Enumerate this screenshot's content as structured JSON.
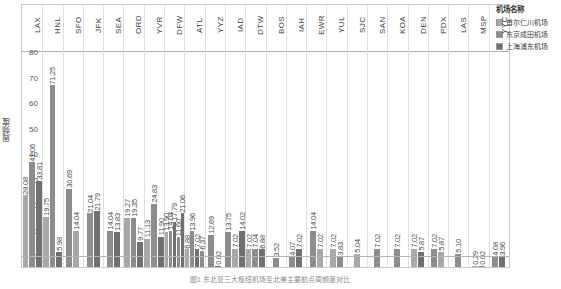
{
  "legend": {
    "title": "机场名称",
    "items": [
      {
        "label": "首尔仁川机场",
        "color": "#a8a8a8"
      },
      {
        "label": "东京成田机场",
        "color": "#8d8d8d"
      },
      {
        "label": "上海浦东机场",
        "color": "#707070"
      }
    ]
  },
  "caption": "图1 东北亚三大枢纽机场至北美主要航点周频度对比",
  "chart_data": {
    "type": "bar",
    "title": "",
    "xlabel": "",
    "ylabel": "周频度",
    "ylim": [
      0,
      80
    ],
    "yticks": [
      0,
      10,
      20,
      30,
      40,
      50,
      60,
      70,
      80
    ],
    "grid": false,
    "legend_position": "right",
    "categories": [
      "LAX",
      "HNL",
      "SFO",
      "JFK",
      "SEA",
      "ORD",
      "YVR",
      "DFW",
      "ATL",
      "YYZ",
      "IAD",
      "DTW",
      "BOS",
      "IAH",
      "EWR",
      "YUL",
      "SJC",
      "SAN",
      "KOA",
      "DEN",
      "PDX",
      "LAS",
      "MSP",
      "YYC"
    ],
    "series": [
      {
        "name": "首尔仁川机场",
        "color": "#a8a8a8",
        "values": [
          28.08,
          19.75,
          30.69,
          21.04,
          14.04,
          19.27,
          11.13,
          13.9,
          6.88,
          12.69,
          13.75,
          7.02,
          6.88,
          7.02,
          14.04,
          7.02,
          5.04,
          7.02,
          7.02,
          7.02,
          5.87,
          0.29,
          4.08,
          null
        ]
      },
      {
        "name": "东京成田机场",
        "color": "#8d8d8d",
        "values": [
          41.06,
          71.25,
          14.04,
          21.79,
          13.83,
          19.35,
          24.83,
          14.04,
          13.96,
          0.02,
          7.02,
          7.04,
          3.52,
          4.07,
          7.02,
          3.83,
          7.02,
          7.02,
          7.02,
          7.02,
          5.1,
          0.02,
          3.96,
          null
        ]
      },
      {
        "name": "上海浦东机场",
        "color": "#707070",
        "values": [
          33.81,
          5.98,
          null,
          null,
          null,
          9.77,
          11.9,
          17.79,
          7.02,
          null,
          14.02,
          6.88,
          null,
          7.02,
          null,
          null,
          null,
          null,
          null,
          5.87,
          null,
          null,
          null,
          null
        ]
      },
      {
        "name": "series-4",
        "color": "#8d8d8d",
        "values": [
          null,
          null,
          null,
          null,
          null,
          null,
          null,
          11.6,
          6.37,
          null,
          null,
          null,
          null,
          null,
          null,
          null,
          null,
          null,
          null,
          null,
          null,
          null,
          null,
          null
        ]
      },
      {
        "name": "series-5",
        "color": "#707070",
        "values": [
          null,
          null,
          null,
          null,
          null,
          null,
          null,
          21.06,
          null,
          null,
          null,
          null,
          null,
          null,
          null,
          null,
          null,
          null,
          null,
          null,
          null,
          null,
          null,
          null
        ]
      }
    ],
    "groups": [
      {
        "code": "LAX",
        "bars": [
          {
            "v": 28.08,
            "c": "#a8a8a8"
          },
          {
            "v": 41.06,
            "c": "#8d8d8d"
          },
          {
            "v": 33.81,
            "c": "#707070"
          }
        ]
      },
      {
        "code": "HNL",
        "bars": [
          {
            "v": 19.75,
            "c": "#a8a8a8"
          },
          {
            "v": 71.25,
            "c": "#8d8d8d"
          },
          {
            "v": 5.98,
            "c": "#707070"
          }
        ]
      },
      {
        "code": "SFO",
        "bars": [
          {
            "v": 30.69,
            "c": "#8d8d8d"
          },
          {
            "v": 14.04,
            "c": "#a8a8a8"
          }
        ]
      },
      {
        "code": "JFK",
        "bars": [
          {
            "v": 21.04,
            "c": "#8d8d8d"
          },
          {
            "v": 21.79,
            "c": "#707070"
          }
        ]
      },
      {
        "code": "SEA",
        "bars": [
          {
            "v": 14.04,
            "c": "#8d8d8d"
          },
          {
            "v": 13.83,
            "c": "#707070"
          }
        ]
      },
      {
        "code": "ORD",
        "bars": [
          {
            "v": 19.27,
            "c": "#a8a8a8"
          },
          {
            "v": 19.35,
            "c": "#8d8d8d"
          },
          {
            "v": 9.77,
            "c": "#707070"
          }
        ]
      },
      {
        "code": "YVR",
        "bars": [
          {
            "v": 11.13,
            "c": "#a8a8a8"
          },
          {
            "v": 24.83,
            "c": "#8d8d8d"
          },
          {
            "v": 11.9,
            "c": "#707070"
          }
        ]
      },
      {
        "code": "DFW",
        "bars": [
          {
            "v": 13.9,
            "c": "#a8a8a8"
          },
          {
            "v": 14.04,
            "c": "#8d8d8d"
          },
          {
            "v": 17.79,
            "c": "#707070"
          },
          {
            "v": 11.6,
            "c": "#8d8d8d"
          },
          {
            "v": 21.06,
            "c": "#707070"
          }
        ]
      },
      {
        "code": "ATL",
        "bars": [
          {
            "v": 6.88,
            "c": "#a8a8a8"
          },
          {
            "v": 13.96,
            "c": "#8d8d8d"
          },
          {
            "v": 7.02,
            "c": "#707070"
          },
          {
            "v": 6.37,
            "c": "#8d8d8d"
          }
        ]
      },
      {
        "code": "YYZ",
        "bars": [
          {
            "v": 12.69,
            "c": "#8d8d8d"
          },
          {
            "v": 0.02,
            "c": "#707070"
          }
        ]
      },
      {
        "code": "IAD",
        "bars": [
          {
            "v": 13.75,
            "c": "#8d8d8d"
          },
          {
            "v": 7.02,
            "c": "#a8a8a8"
          },
          {
            "v": 14.02,
            "c": "#707070"
          }
        ]
      },
      {
        "code": "DTW",
        "bars": [
          {
            "v": 7.02,
            "c": "#a8a8a8"
          },
          {
            "v": 7.04,
            "c": "#8d8d8d"
          },
          {
            "v": 6.88,
            "c": "#707070"
          }
        ]
      },
      {
        "code": "BOS",
        "bars": [
          {
            "v": 3.52,
            "c": "#8d8d8d"
          }
        ]
      },
      {
        "code": "IAH",
        "bars": [
          {
            "v": 4.07,
            "c": "#8d8d8d"
          },
          {
            "v": 7.02,
            "c": "#707070"
          }
        ]
      },
      {
        "code": "EWR",
        "bars": [
          {
            "v": 14.04,
            "c": "#8d8d8d"
          },
          {
            "v": 7.02,
            "c": "#a8a8a8"
          }
        ]
      },
      {
        "code": "YUL",
        "bars": [
          {
            "v": 7.02,
            "c": "#a8a8a8"
          },
          {
            "v": 3.83,
            "c": "#8d8d8d"
          }
        ]
      },
      {
        "code": "SJC",
        "bars": [
          {
            "v": 5.04,
            "c": "#a8a8a8"
          }
        ]
      },
      {
        "code": "SAN",
        "bars": [
          {
            "v": 7.02,
            "c": "#8d8d8d"
          }
        ]
      },
      {
        "code": "KOA",
        "bars": [
          {
            "v": 7.02,
            "c": "#8d8d8d"
          }
        ]
      },
      {
        "code": "DEN",
        "bars": [
          {
            "v": 7.02,
            "c": "#a8a8a8"
          },
          {
            "v": 5.87,
            "c": "#707070"
          }
        ]
      },
      {
        "code": "PDX",
        "bars": [
          {
            "v": 7.02,
            "c": "#8d8d8d"
          },
          {
            "v": 5.87,
            "c": "#a8a8a8"
          }
        ]
      },
      {
        "code": "LAS",
        "bars": [
          {
            "v": 5.1,
            "c": "#8d8d8d"
          }
        ]
      },
      {
        "code": "MSP",
        "bars": [
          {
            "v": 0.29,
            "c": "#a8a8a8"
          },
          {
            "v": 0.02,
            "c": "#8d8d8d"
          }
        ]
      },
      {
        "code": "YYC",
        "bars": [
          {
            "v": 4.08,
            "c": "#8d8d8d"
          },
          {
            "v": 3.96,
            "c": "#707070"
          }
        ]
      }
    ]
  }
}
